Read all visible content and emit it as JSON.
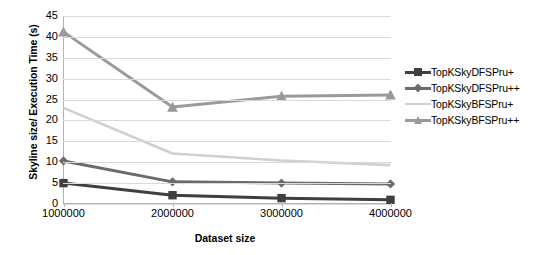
{
  "chart_data": {
    "type": "line",
    "title": "",
    "xlabel": "Dataset size",
    "ylabel": "Skyline size/ Execution Time (s)",
    "x": [
      1000000,
      2000000,
      3000000,
      4000000
    ],
    "xticklabels": [
      "1000000",
      "2000000",
      "3000000",
      "4000000"
    ],
    "yticklabels": [
      "0",
      "5",
      "10",
      "15",
      "20",
      "25",
      "30",
      "35",
      "40",
      "45"
    ],
    "yticks": [
      0,
      5,
      10,
      15,
      20,
      25,
      30,
      35,
      40,
      45
    ],
    "ylim": [
      0,
      45
    ],
    "grid": true,
    "legend_position": "right",
    "series": [
      {
        "name": "TopKSkyDFSPru+",
        "values": [
          5.0,
          2.1,
          1.4,
          1.0
        ],
        "color": "#3f3f3f",
        "marker": "square"
      },
      {
        "name": "TopKSkyDFSPru++",
        "values": [
          10.3,
          5.3,
          5.0,
          4.8
        ],
        "color": "#6b6b6b",
        "marker": "diamond"
      },
      {
        "name": "TopKSkyBFSPru+",
        "values": [
          23.0,
          12.1,
          10.4,
          9.3
        ],
        "color": "#d0d0d0",
        "marker": "none"
      },
      {
        "name": "TopKSkyBFSPru++",
        "values": [
          41.2,
          23.2,
          25.8,
          26.1
        ],
        "color": "#9a9a9a",
        "marker": "triangle"
      }
    ]
  },
  "legend": {
    "entries": [
      {
        "label": "TopKSkyDFSPru+"
      },
      {
        "label": "TopKSkyDFSPru++"
      },
      {
        "label": "TopKSkyBFSPru+"
      },
      {
        "label": "TopKSkyBFSPru++"
      }
    ]
  },
  "colors": {
    "series1": "#3f3f3f",
    "series2": "#6b6b6b",
    "series3": "#d0d0d0",
    "series4": "#9a9a9a",
    "gridline": "#d9d9d9",
    "axis": "#b3b3b3",
    "text": "#000000",
    "background": "#ffffff"
  }
}
